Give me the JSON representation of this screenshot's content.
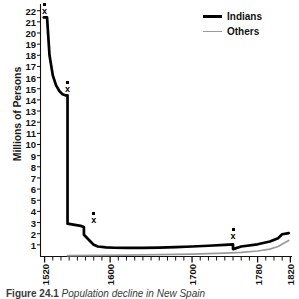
{
  "figure": {
    "caption_number": "Figure 24.1",
    "caption_text": "Population decline in New Spain"
  },
  "legend": {
    "position": "top-right",
    "entries": [
      {
        "label": "Indians",
        "color": "#000000",
        "style": "thick-solid"
      },
      {
        "label": "Others",
        "color": "#9a9a9a",
        "style": "thin-solid"
      }
    ]
  },
  "axes": {
    "ylabel": "Millions of Persons",
    "yticks": [
      22,
      21,
      20,
      19,
      18,
      17,
      16,
      15,
      14,
      13,
      12,
      11,
      10,
      9,
      8,
      7,
      6,
      5,
      4,
      3,
      2,
      1
    ],
    "ylim": [
      0,
      22.6
    ],
    "xticks_labeled": [
      1520,
      1600,
      1700,
      1780,
      1820
    ],
    "xlim": [
      1515,
      1822
    ],
    "xtick_step_minor": 10,
    "xlabel": "",
    "grid": false
  },
  "chart_data": {
    "type": "line",
    "title": "Population decline in New Spain",
    "xlabel": "",
    "ylabel": "Millions of Persons",
    "xlim": [
      1515,
      1822
    ],
    "ylim": [
      0,
      22.6
    ],
    "grid": false,
    "legend_position": "top-right",
    "series": [
      {
        "name": "Indians",
        "color": "#000000",
        "x": [
          1519,
          1523,
          1526,
          1530,
          1534,
          1538,
          1542,
          1546,
          1548,
          1548,
          1564,
          1568,
          1568,
          1576,
          1580,
          1585,
          1595,
          1605,
          1620,
          1640,
          1660,
          1680,
          1700,
          1720,
          1740,
          1750,
          1750,
          1760,
          1780,
          1795,
          1805,
          1810,
          1818
        ],
        "y": [
          21.4,
          21.4,
          18.0,
          16.2,
          15.3,
          14.8,
          14.5,
          14.4,
          14.4,
          2.9,
          2.7,
          2.6,
          1.9,
          1.3,
          1.0,
          0.85,
          0.78,
          0.74,
          0.72,
          0.73,
          0.76,
          0.8,
          0.85,
          0.92,
          1.0,
          1.05,
          0.62,
          0.85,
          1.05,
          1.3,
          1.6,
          1.95,
          2.05
        ]
      },
      {
        "name": "Others",
        "color": "#9a9a9a",
        "x": [
          1548,
          1580,
          1620,
          1660,
          1700,
          1740,
          1760,
          1780,
          1795,
          1805,
          1812,
          1818
        ],
        "y": [
          0.03,
          0.05,
          0.08,
          0.12,
          0.17,
          0.26,
          0.33,
          0.45,
          0.62,
          0.85,
          1.15,
          1.4
        ]
      }
    ],
    "markers": [
      {
        "series": "Indians",
        "x": 1520,
        "y": 21.4,
        "symbol": "x-with-dot"
      },
      {
        "series": "Indians",
        "x": 1548,
        "y": 14.4,
        "symbol": "x-with-dot"
      },
      {
        "series": "Indians",
        "x": 1580,
        "y": 2.7,
        "symbol": "x-with-dot"
      },
      {
        "series": "Indians",
        "x": 1750,
        "y": 1.3,
        "symbol": "x-with-dot"
      }
    ]
  }
}
